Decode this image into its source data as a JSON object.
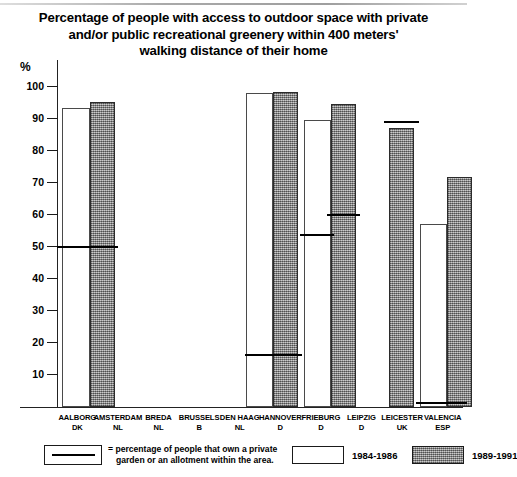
{
  "chart_data": {
    "type": "bar",
    "title": "Percentage of people with access to outdoor space with private and/or public recreational greenery within 400 meters' walking distance of their home",
    "title_lines": [
      "Percentage of people with access to outdoor space with private",
      "and/or public recreational greenery within 400 meters'",
      "walking distance of their home"
    ],
    "xlabel": "",
    "ylabel": "%",
    "ylim": [
      0,
      100
    ],
    "yticks": [
      10,
      20,
      30,
      40,
      50,
      60,
      70,
      80,
      90,
      100
    ],
    "grid": false,
    "legend_position": "bottom",
    "categories": [
      "AALBORG DK",
      "AMSTERDAM NL",
      "BREDA NL",
      "BRUSSELS B",
      "DEN HAAG NL",
      "HANNOVER D",
      "FRIEBURG D",
      "LEIPZIG D",
      "LEICESTER UK",
      "VALENCIA ESP"
    ],
    "category_labels": [
      {
        "city": "AALBORG",
        "country": "DK"
      },
      {
        "city": "AMSTERDAM",
        "country": "NL"
      },
      {
        "city": "BREDA",
        "country": "NL"
      },
      {
        "city": "BRUSSELS",
        "country": "B"
      },
      {
        "city": "DEN HAAG",
        "country": "NL"
      },
      {
        "city": "HANNOVER",
        "country": "D"
      },
      {
        "city": "FRIEBURG",
        "country": "D"
      },
      {
        "city": "LEIPZIG",
        "country": "D"
      },
      {
        "city": "LEICESTER",
        "country": "UK"
      },
      {
        "city": "VALENCIA",
        "country": "ESP"
      }
    ],
    "series": [
      {
        "name": "1984-1986",
        "values": [
          93,
          null,
          null,
          null,
          null,
          98,
          89.5,
          null,
          null,
          57
        ]
      },
      {
        "name": "1989-1991",
        "values": [
          95,
          null,
          null,
          null,
          null,
          98,
          94.5,
          null,
          87,
          71.5
        ]
      }
    ],
    "private_garden_markers": [
      {
        "category": "AALBORG DK",
        "series": "1984-1986",
        "value": 50
      },
      {
        "category": "AALBORG DK",
        "series": "1989-1991",
        "value": 50
      },
      {
        "category": "HANNOVER D",
        "series": "1984-1986",
        "value": 18
      },
      {
        "category": "HANNOVER D",
        "series": "1989-1991",
        "value": 18
      },
      {
        "category": "FRIEBURG D",
        "series": "1984-1986",
        "value": 54
      },
      {
        "category": "FRIEBURG D",
        "series": "1989-1991",
        "value": 60
      },
      {
        "category": "LEICESTER UK",
        "series": "1989-1991",
        "value": 89
      },
      {
        "category": "VALENCIA ESP",
        "series": "1984-1986",
        "value": 1.5
      },
      {
        "category": "VALENCIA ESP",
        "series": "1989-1991",
        "value": 1.5
      }
    ],
    "colors": {
      "series_1984_1986": "#ffffff",
      "series_1989_1991": "#9b9b9b",
      "axis": "#222222",
      "marker_line": "#000000",
      "text": "#000000",
      "background": "#ffffff"
    }
  },
  "legend": {
    "marker_description_line1": "= percentage of people that own a private",
    "marker_description_line2": "garden or an allotment within the area.",
    "series_white_label": "1984-1986",
    "series_gray_label": "1989-1991"
  }
}
